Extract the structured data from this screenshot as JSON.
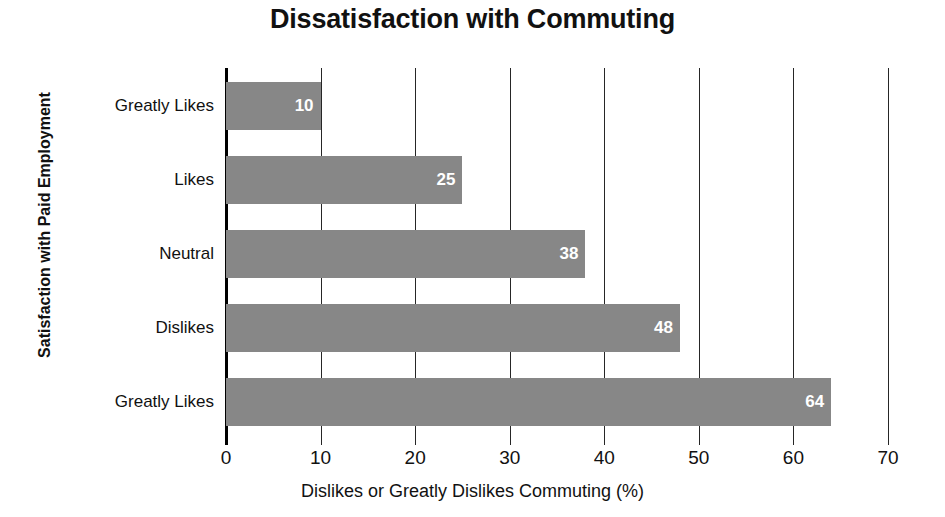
{
  "chart_data": {
    "type": "bar",
    "orientation": "horizontal",
    "title": "Dissatisfaction with Commuting",
    "xlabel": "Dislikes or Greatly Dislikes Commuting (%)",
    "ylabel": "Satisfaction with Paid Employment",
    "categories": [
      "Greatly Likes",
      "Likes",
      "Neutral",
      "Dislikes",
      "Greatly Likes"
    ],
    "values": [
      10,
      25,
      38,
      48,
      64
    ],
    "value_labels": [
      "10",
      "25",
      "38",
      "48",
      "64"
    ],
    "xlim": [
      0,
      70
    ],
    "xticks": [
      0,
      10,
      20,
      30,
      40,
      50,
      60,
      70
    ],
    "xtick_labels": [
      "0",
      "10",
      "20",
      "30",
      "40",
      "50",
      "60",
      "70"
    ],
    "grid": "vertical",
    "legend": null,
    "bar_color": "#878787",
    "value_label_color": "#ffffff",
    "axis_color": "#000000",
    "background": "#ffffff"
  }
}
